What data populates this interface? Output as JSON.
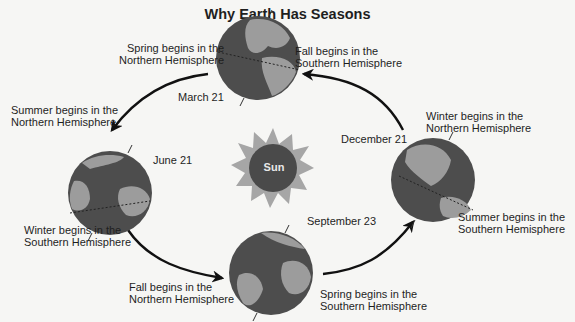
{
  "title": "Why Earth Has Seasons",
  "sun": {
    "label": "Sun",
    "core_color": "#4a4a4a",
    "ray_color": "#a6a6a6"
  },
  "colors": {
    "ocean": "#4d4d4d",
    "land": "#9c9c9c",
    "arrow": "#111111"
  },
  "positions": [
    {
      "date": "March 21",
      "north_label": [
        "Spring begins in the",
        "Northern Hemisphere"
      ],
      "south_label": [
        "Fall begins in the",
        "Southern Hemisphere"
      ]
    },
    {
      "date": "June 21",
      "north_label": [
        "Summer begins in the",
        "Northern Hemisphere"
      ],
      "south_label": [
        "Winter begins in the",
        "Southern Hemisphere"
      ]
    },
    {
      "date": "September 23",
      "north_label": [
        "Fall begins in the",
        "Northern Hemisphere"
      ],
      "south_label": [
        "Spring begins in the",
        "Southern Hemisphere"
      ]
    },
    {
      "date": "December 21",
      "north_label": [
        "Winter begins in the",
        "Northern Hemisphere"
      ],
      "south_label": [
        "Summer begins in the",
        "Southern Hemisphere"
      ]
    }
  ]
}
